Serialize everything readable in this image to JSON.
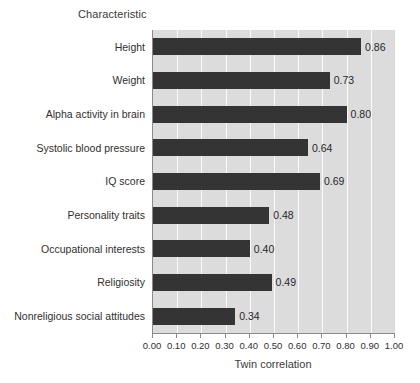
{
  "chart_data": {
    "type": "bar",
    "orientation": "horizontal",
    "title": "",
    "xlabel": "Twin correlation",
    "ylabel": "Characteristic",
    "categories": [
      "Height",
      "Weight",
      "Alpha activity in brain",
      "Systolic blood pressure",
      "IQ score",
      "Personality traits",
      "Occupational interests",
      "Religiosity",
      "Nonreligious social attitudes"
    ],
    "values": [
      0.86,
      0.73,
      0.8,
      0.64,
      0.69,
      0.48,
      0.4,
      0.49,
      0.34
    ],
    "value_labels": [
      "0.86",
      "0.73",
      "0.80",
      "0.64",
      "0.69",
      "0.48",
      "0.40",
      "0.49",
      "0.34"
    ],
    "xlim": [
      0.0,
      1.0
    ],
    "xticks": [
      0.0,
      0.1,
      0.2,
      0.3,
      0.4,
      0.5,
      0.6,
      0.7,
      0.8,
      0.9,
      1.0
    ],
    "xtick_labels": [
      "0.00",
      "0.10",
      "0.20",
      "0.30",
      "0.40",
      "0.50",
      "0.60",
      "0.70",
      "0.80",
      "0.90",
      "1.00"
    ],
    "grid": "vertical",
    "legend": "none",
    "colors": {
      "bar": "#343434",
      "plot_background": "#dcdcdc",
      "gridline": "#fbfbfb",
      "axis": "#8a8a8a",
      "text": "#2f2f2f",
      "figure_background": "#ffffff"
    }
  }
}
